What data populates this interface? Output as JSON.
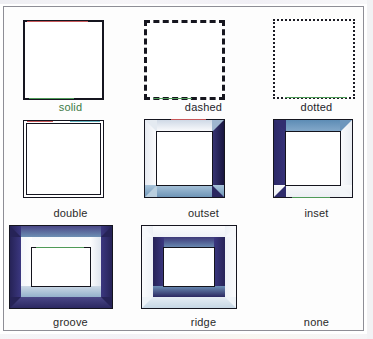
{
  "page": {
    "background_color": "#ffffff",
    "frame_color": "#8e8e96"
  },
  "samples": [
    {
      "id": "solid",
      "label": "solid",
      "border_style": "solid",
      "border_width_px": 2,
      "border_color": "#15151f",
      "row": 1,
      "column": 1
    },
    {
      "id": "dashed",
      "label": "dashed",
      "border_style": "dashed",
      "border_width_px": 3,
      "border_color": "#16161f",
      "row": 1,
      "column": 2
    },
    {
      "id": "dotted",
      "label": "dotted",
      "border_style": "dotted",
      "border_width_px": 2,
      "border_color": "#1b1b24",
      "row": 1,
      "column": 3
    },
    {
      "id": "double",
      "label": "double",
      "border_style": "double",
      "border_width_px": 4,
      "border_color": "#15151f",
      "row": 2,
      "column": 1
    },
    {
      "id": "outset",
      "label": "outset",
      "border_style": "outset",
      "border_width_px": 12,
      "border_color": "#2c2a63",
      "highlight_color": "#fbfbfd",
      "shadow_color": "#23214f",
      "row": 2,
      "column": 2
    },
    {
      "id": "inset",
      "label": "inset",
      "border_style": "inset",
      "border_width_px": 12,
      "border_color": "#2c2a63",
      "highlight_color": "#fbfbfd",
      "shadow_color": "#2a2760",
      "row": 2,
      "column": 3
    },
    {
      "id": "groove",
      "label": "groove",
      "border_style": "groove",
      "border_width_px": 22,
      "border_color": "#2c2a63",
      "row": 3,
      "column": 1
    },
    {
      "id": "ridge",
      "label": "ridge",
      "border_style": "ridge",
      "border_width_px": 22,
      "border_color": "#2c2a63",
      "row": 3,
      "column": 2
    },
    {
      "id": "none",
      "label": "none",
      "border_style": "none",
      "border_width_px": 0,
      "border_color": "transparent",
      "row": 3,
      "column": 3
    }
  ]
}
